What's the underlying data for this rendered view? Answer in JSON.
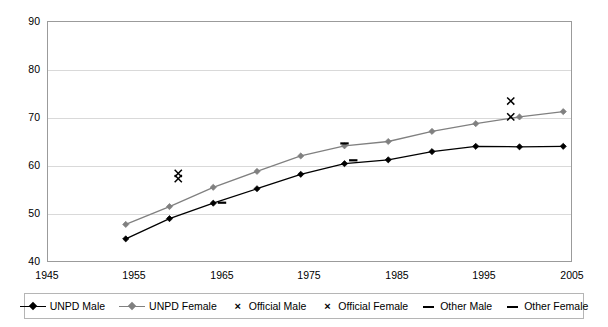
{
  "chart_data": {
    "type": "line",
    "title": "",
    "subtitle": "",
    "xlabel": "",
    "ylabel": "",
    "xlim": [
      1945,
      2005
    ],
    "ylim": [
      40,
      90
    ],
    "xticks": [
      1945,
      1955,
      1965,
      1975,
      1985,
      1995,
      2005
    ],
    "yticks": [
      40,
      50,
      60,
      70,
      80,
      90
    ],
    "grid": "horizontal",
    "legend_position": "bottom",
    "series": [
      {
        "name": "UNPD Male",
        "type": "line",
        "marker": "diamond",
        "color": "#000000",
        "x": [
          1954,
          1959,
          1964,
          1969,
          1974,
          1979,
          1984,
          1989,
          1994,
          1999,
          2004
        ],
        "values": [
          44.8,
          49.0,
          52.2,
          55.2,
          58.2,
          60.4,
          61.2,
          62.9,
          64.0,
          63.9,
          64.0
        ]
      },
      {
        "name": "UNPD Female",
        "type": "line",
        "marker": "diamond",
        "color": "#808080",
        "x": [
          1954,
          1959,
          1964,
          1969,
          1974,
          1979,
          1984,
          1989,
          1994,
          1999,
          2004
        ],
        "values": [
          47.8,
          51.5,
          55.5,
          58.8,
          62.0,
          64.1,
          65.0,
          67.1,
          68.7,
          70.1,
          71.2
        ]
      },
      {
        "name": "Official Male",
        "type": "scatter",
        "marker": "x",
        "color": "#000000",
        "x": [
          1960,
          1998
        ],
        "values": [
          57.3,
          70.1
        ]
      },
      {
        "name": "Official Female",
        "type": "scatter",
        "marker": "x",
        "color": "#000000",
        "x": [
          1960,
          1998
        ],
        "values": [
          58.4,
          73.4
        ]
      },
      {
        "name": "Other Male",
        "type": "scatter",
        "marker": "dash",
        "color": "#000000",
        "x": [
          1965,
          1980
        ],
        "values": [
          52.3,
          61.1
        ]
      },
      {
        "name": "Other Female",
        "type": "scatter",
        "marker": "dash",
        "color": "#000000",
        "x": [
          1979
        ],
        "values": [
          64.6
        ]
      }
    ]
  },
  "legend": {
    "items": [
      {
        "label": "UNPD Male",
        "marker": "line-diamond",
        "color": "#000000"
      },
      {
        "label": "UNPD Female",
        "marker": "line-diamond",
        "color": "#808080"
      },
      {
        "label": "Official Male",
        "marker": "x",
        "color": "#000000"
      },
      {
        "label": "Official Female",
        "marker": "x",
        "color": "#000000"
      },
      {
        "label": "Other Male",
        "marker": "dash",
        "color": "#000000"
      },
      {
        "label": "Other Female",
        "marker": "dash",
        "color": "#000000"
      }
    ]
  },
  "axes": {
    "y_tick_labels": [
      "90",
      "80",
      "70",
      "60",
      "50",
      "40"
    ],
    "x_tick_labels": [
      "1945",
      "1955",
      "1965",
      "1975",
      "1985",
      "1995",
      "2005"
    ]
  },
  "colors": {
    "male_line": "#000000",
    "female_line": "#808080",
    "grid": "#d9d9d9",
    "frame": "#9b9b9b",
    "legend_border": "#b5b5b5",
    "background": "#ffffff"
  }
}
